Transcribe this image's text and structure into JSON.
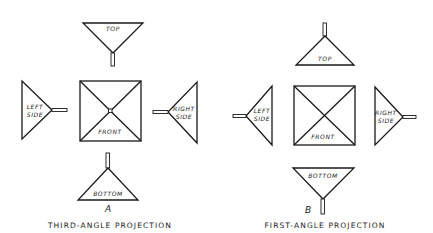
{
  "figure": {
    "panels": [
      {
        "id": "A",
        "letter": "A",
        "caption": "THIRD-ANGLE PROJECTION",
        "views": {
          "top": "TOP",
          "front": "FRONT",
          "left_line1": "LEFT",
          "left_line2": "SIDE",
          "right_line1": "RIGHT",
          "right_line2": "SIDE",
          "bottom": "BOTTOM"
        }
      },
      {
        "id": "B",
        "letter": "B",
        "caption": "FIRST-ANGLE PROJECTION",
        "views": {
          "top": "TOP",
          "front": "FRONT",
          "left_line1": "LEFT",
          "left_line2": "SIDE",
          "right_line1": "RIGHT",
          "right_line2": "SIDE",
          "bottom": "BOTTOM"
        }
      }
    ]
  }
}
